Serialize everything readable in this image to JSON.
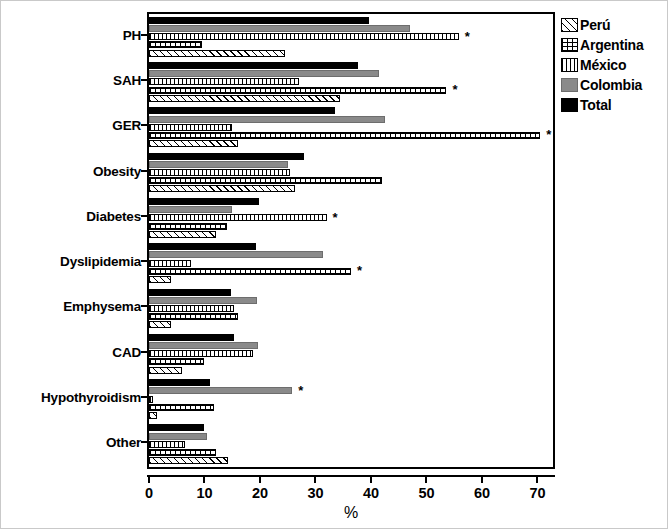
{
  "chart_data": {
    "type": "bar",
    "orientation": "horizontal",
    "title": "",
    "xlabel": "%",
    "ylabel": "",
    "xlim": [
      0,
      72.8
    ],
    "xticks": [
      0,
      10,
      20,
      30,
      40,
      50,
      60,
      70
    ],
    "grid": false,
    "legend_position": "right-top",
    "categories": [
      "PH",
      "SAH",
      "GER",
      "Obesity",
      "Diabetes",
      "Dyslipidemia",
      "Emphysema",
      "CAD",
      "Hypothyroidism",
      "Other"
    ],
    "series": [
      {
        "name": "Total",
        "pattern": "solid-black",
        "color": "#000000",
        "values": [
          39.6,
          37.6,
          33.6,
          28.0,
          19.8,
          19.3,
          14.8,
          15.3,
          11.0,
          10.0
        ],
        "significant": [
          false,
          false,
          false,
          false,
          false,
          false,
          false,
          false,
          false,
          false
        ]
      },
      {
        "name": "Colombia",
        "pattern": "solid-gray",
        "color": "#8a8a8a",
        "values": [
          47.0,
          41.5,
          42.6,
          25.0,
          15.0,
          31.3,
          19.5,
          19.6,
          25.8,
          10.5
        ],
        "significant": [
          false,
          false,
          false,
          false,
          false,
          false,
          false,
          false,
          true,
          false
        ]
      },
      {
        "name": "México",
        "pattern": "vertical-lines",
        "color": "#ffffff",
        "values": [
          55.8,
          27.0,
          15.0,
          25.4,
          32.0,
          7.5,
          15.3,
          18.8,
          0.8,
          6.5
        ],
        "significant": [
          true,
          false,
          false,
          false,
          true,
          false,
          false,
          false,
          false,
          false
        ]
      },
      {
        "name": "Argentina",
        "pattern": "dotted-grid",
        "color": "#ffffff",
        "values": [
          9.5,
          53.6,
          70.5,
          42.0,
          14.0,
          36.4,
          16.0,
          10.0,
          11.8,
          12.0
        ],
        "significant": [
          false,
          true,
          true,
          false,
          false,
          true,
          false,
          false,
          false,
          false
        ]
      },
      {
        "name": "Perú",
        "pattern": "diagonal-hatch",
        "color": "#ffffff",
        "values": [
          24.5,
          34.4,
          16.0,
          26.3,
          12.0,
          4.0,
          4.0,
          6.0,
          1.5,
          14.3
        ],
        "significant": [
          false,
          false,
          false,
          false,
          false,
          false,
          false,
          false,
          false,
          false
        ]
      }
    ],
    "series_draw_order_top_to_bottom": [
      "Total",
      "Colombia",
      "México",
      "Argentina",
      "Perú"
    ],
    "significance_marker": "*",
    "annotations": [
      {
        "category": "PH",
        "series": "México",
        "marker": "*"
      },
      {
        "category": "SAH",
        "series": "Argentina",
        "marker": "*"
      },
      {
        "category": "GER",
        "series": "Argentina",
        "marker": "*"
      },
      {
        "category": "Diabetes",
        "series": "México",
        "marker": "*"
      },
      {
        "category": "Dyslipidemia",
        "series": "Argentina",
        "marker": "*"
      },
      {
        "category": "Hypothyroidism",
        "series": "Colombia",
        "marker": "*"
      }
    ]
  },
  "legend": {
    "items": [
      {
        "label": "Perú",
        "pattern": "diagonal-hatch"
      },
      {
        "label": "Argentina",
        "pattern": "dotted-grid"
      },
      {
        "label": "México",
        "pattern": "vertical-lines"
      },
      {
        "label": "Colombia",
        "pattern": "solid-gray"
      },
      {
        "label": "Total",
        "pattern": "solid-black"
      }
    ]
  },
  "axis": {
    "x_title": "%",
    "x_tick_labels": [
      "0",
      "10",
      "20",
      "30",
      "40",
      "50",
      "60",
      "70"
    ],
    "y_tick_labels": [
      "PH",
      "SAH",
      "GER",
      "Obesity",
      "Diabetes",
      "Dyslipidemia",
      "Emphysema",
      "CAD",
      "Hypothyroidism",
      "Other"
    ]
  }
}
